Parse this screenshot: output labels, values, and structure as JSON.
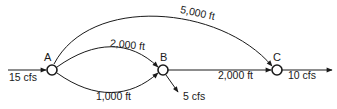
{
  "diagram": {
    "type": "pipe-network",
    "nodes": [
      {
        "id": "A",
        "label": "A"
      },
      {
        "id": "B",
        "label": "B"
      },
      {
        "id": "C",
        "label": "C"
      }
    ],
    "edges": [
      {
        "from": "A",
        "to": "C",
        "label": "5,000 ft"
      },
      {
        "from": "A",
        "to": "B",
        "label": "2,000 ft",
        "route": "upper"
      },
      {
        "from": "A",
        "to": "B",
        "label": "1,000 ft",
        "route": "lower"
      },
      {
        "from": "B",
        "to": "C",
        "label": "2,000 ft"
      }
    ],
    "flows": {
      "inflow_A": "15 cfs",
      "outflow_B": "5 cfs",
      "outflow_C": "10 cfs"
    }
  }
}
